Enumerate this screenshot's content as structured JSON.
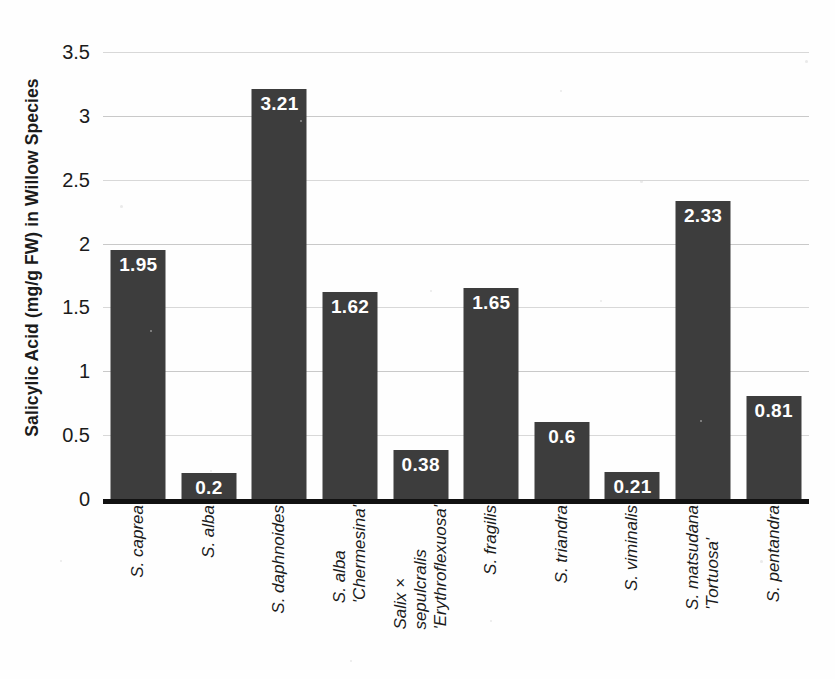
{
  "chart_data": {
    "type": "bar",
    "title": "",
    "xlabel": "",
    "ylabel": "Salicylic Acid (mg/g FW) in Willow Species",
    "ylim": [
      0,
      3.5
    ],
    "ytick_labels": [
      "0",
      "0.5",
      "1",
      "1.5",
      "2",
      "2.5",
      "3",
      "3.5"
    ],
    "ytick_values": [
      0,
      0.5,
      1,
      1.5,
      2,
      2.5,
      3,
      3.5
    ],
    "grid": true,
    "legend": false,
    "bar_color": "#3d3d3d",
    "value_label_color": "#ffffff",
    "categories": [
      "S. caprea",
      "S. alba",
      "S. daphnoides",
      "S. alba 'Chermesina'",
      "Salix × sepulcralis 'Erythroflexuosa'",
      "S. fragilis",
      "S. triandra",
      "S. viminalis",
      "S. matsudana 'Tortuosa'",
      "S. pentandra"
    ],
    "category_lines": [
      [
        "S. caprea"
      ],
      [
        "S. alba"
      ],
      [
        "S. daphnoides"
      ],
      [
        "S. alba",
        "'Chermesina'"
      ],
      [
        "Salix ×",
        "sepulcralis",
        "'Erythroflexuosa'"
      ],
      [
        "S. fragilis"
      ],
      [
        "S. triandra"
      ],
      [
        "S. viminalis"
      ],
      [
        "S. matsudana",
        "'Tortuosa'"
      ],
      [
        "S. pentandra"
      ]
    ],
    "values": [
      1.95,
      0.2,
      3.21,
      1.62,
      0.38,
      1.65,
      0.6,
      0.21,
      2.33,
      0.81
    ],
    "value_labels": [
      "1.95",
      "0.2",
      "3.21",
      "1.62",
      "0.38",
      "1.65",
      "0.6",
      "0.21",
      "2.33",
      "0.81"
    ]
  }
}
